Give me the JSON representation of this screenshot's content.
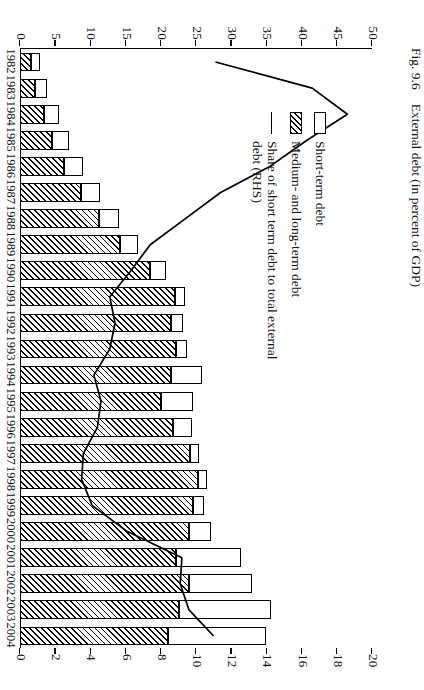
{
  "caption": {
    "figure_number": "Fig. 9.6",
    "title": "External debt (in percent of GDP)"
  },
  "legend": {
    "items": [
      {
        "key": "open-square",
        "label": "Short-term debt"
      },
      {
        "key": "hatched-square",
        "label": "Medium- and long-term debt"
      },
      {
        "key": "line",
        "label": "Share of short term debt to total external debt (RHS)"
      }
    ]
  },
  "axes": {
    "left": {
      "label": "",
      "min": 0,
      "max": 50,
      "ticks": [
        0,
        5,
        10,
        15,
        20,
        25,
        30,
        35,
        40,
        45,
        50
      ]
    },
    "right": {
      "label": "",
      "min": 0,
      "max": 20,
      "ticks": [
        0,
        2,
        4,
        6,
        8,
        10,
        12,
        14,
        16,
        18,
        20
      ]
    }
  },
  "chart_data": {
    "type": "bar",
    "title": "External debt (in percent of GDP)",
    "xlabel": "",
    "ylabel": "",
    "ylim": [
      0,
      50
    ],
    "y2lim": [
      0,
      20
    ],
    "grid": false,
    "legend_position": "inside-left",
    "stacked": true,
    "categories": [
      "1982",
      "1983",
      "1984",
      "1985",
      "1986",
      "1987",
      "1988",
      "1989",
      "1990",
      "1991",
      "1992",
      "1993",
      "1994",
      "1995",
      "1996",
      "1997",
      "1998",
      "1999",
      "2000",
      "2001",
      "2002",
      "2003",
      "2004"
    ],
    "series": [
      {
        "name": "Medium- and long-term debt",
        "axis": "left",
        "style": "hatched",
        "values": [
          1.6,
          2.2,
          3.4,
          4.6,
          6.3,
          8.6,
          11.2,
          14.2,
          18.4,
          22.0,
          21.5,
          22.2,
          21.5,
          20.0,
          21.8,
          24.2,
          25.3,
          24.6,
          24.0,
          22.2,
          24.0,
          22.6,
          21.0
        ]
      },
      {
        "name": "Short-term debt",
        "axis": "left",
        "style": "open",
        "values": [
          1.3,
          1.6,
          2.2,
          2.4,
          2.6,
          2.7,
          2.9,
          2.6,
          2.3,
          1.5,
          1.6,
          1.5,
          4.3,
          4.6,
          2.6,
          1.3,
          1.2,
          1.6,
          3.1,
          9.2,
          9.0,
          13.0,
          14.0
        ]
      },
      {
        "name": "Share of short term debt to total external debt (RHS)",
        "axis": "right",
        "style": "line",
        "values": [
          11.1,
          16.6,
          18.6,
          16.3,
          14.2,
          11.4,
          9.4,
          7.4,
          6.3,
          5.1,
          5.4,
          5.1,
          4.2,
          4.6,
          4.4,
          3.6,
          3.5,
          4.1,
          6.1,
          9.2,
          9.1,
          9.6,
          11.0
        ]
      }
    ]
  }
}
